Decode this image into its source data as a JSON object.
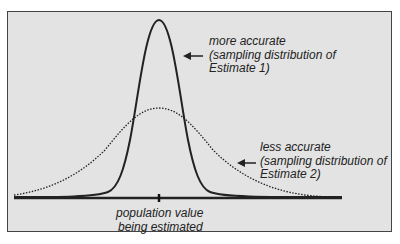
{
  "diagram": {
    "type": "sampling-distributions-comparison",
    "curves": [
      {
        "name": "Estimate 1",
        "style": "solid",
        "spread": "narrow",
        "peak_height": "tall"
      },
      {
        "name": "Estimate 2",
        "style": "dotted",
        "spread": "wide",
        "peak_height": "short"
      }
    ],
    "colors": {
      "background": "#e3e3e3",
      "stroke": "#222222",
      "frame": "#444444"
    }
  },
  "labels": {
    "estimate1": {
      "line1": "more accurate",
      "line2": "(sampling distribution of",
      "line3": "Estimate 1)"
    },
    "estimate2": {
      "line1": "less accurate",
      "line2": "(sampling distribution of",
      "line3": "Estimate 2)"
    },
    "population": {
      "line1": "population value",
      "line2": "being estimated"
    }
  }
}
